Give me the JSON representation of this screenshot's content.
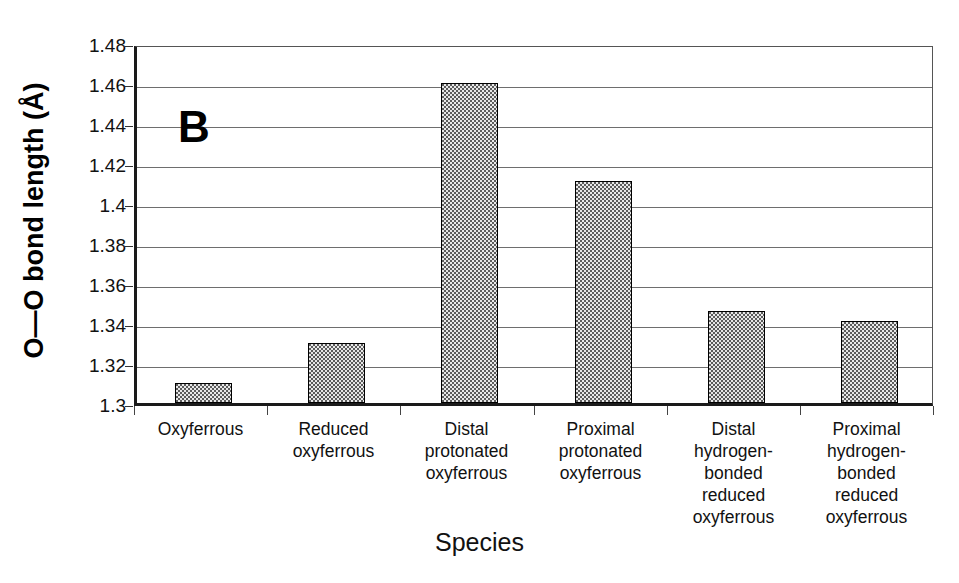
{
  "panel": {
    "label": "B"
  },
  "axes": {
    "y_title": "O—O bond length (Å)",
    "x_title": "Species",
    "y_ticks": [
      "1.3",
      "1.32",
      "1.34",
      "1.36",
      "1.38",
      "1.4",
      "1.42",
      "1.44",
      "1.46",
      "1.48"
    ]
  },
  "chart_data": {
    "type": "bar",
    "title": "",
    "panel_label": "B",
    "xlabel": "Species",
    "ylabel": "O—O bond length (Å)",
    "ylim": [
      1.3,
      1.48
    ],
    "ytick_step": 0.02,
    "ytick_labels": [
      "1.3",
      "1.32",
      "1.34",
      "1.36",
      "1.38",
      "1.4",
      "1.42",
      "1.44",
      "1.46",
      "1.48"
    ],
    "grid": true,
    "legend": "none",
    "categories": [
      "Oxyferrous",
      "Reduced oxyferrous",
      "Distal protonated oxyferrous",
      "Proximal protonated oxyferrous",
      "Distal hydrogen-bonded reduced oxyferrous",
      "Proximal hydrogen-bonded reduced oxyferrous"
    ],
    "category_label_lines": [
      [
        "Oxyferrous"
      ],
      [
        "Reduced",
        "oxyferrous"
      ],
      [
        "Distal",
        "protonated",
        "oxyferrous"
      ],
      [
        "Proximal",
        "protonated",
        "oxyferrous"
      ],
      [
        "Distal",
        "hydrogen-",
        "bonded",
        "reduced",
        "oxyferrous"
      ],
      [
        "Proximal",
        "hydrogen-",
        "bonded",
        "reduced",
        "oxyferrous"
      ]
    ],
    "values": [
      1.31,
      1.33,
      1.46,
      1.411,
      1.346,
      1.341
    ],
    "bar_fill": "#c9c9c9",
    "bar_edge": "#000000"
  }
}
